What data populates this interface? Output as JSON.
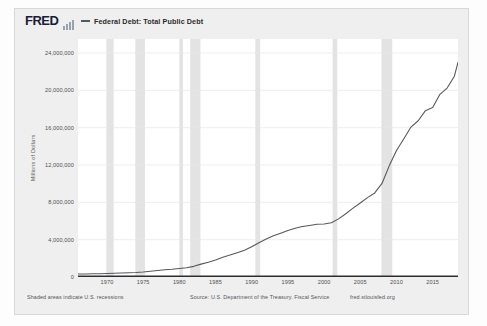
{
  "header": {
    "logo_text": "FRED",
    "sparkline_icon": "sparkline-icon",
    "legend_label": "Federal Debt: Total Public Debt",
    "legend_color": "#55585f"
  },
  "footer": {
    "recessions_note": "Shaded areas indicate U.S. recessions",
    "source": "Source: U.S. Department of the Treasury. Fiscal Service",
    "url": "fred.stlouisfed.org"
  },
  "chart_data": {
    "type": "line",
    "title": "Federal Debt: Total Public Debt",
    "xlabel": "",
    "ylabel": "Millions of Dollars",
    "xlim": [
      1966,
      2018.5
    ],
    "ylim": [
      0,
      25500000
    ],
    "grid": true,
    "legend_position": "top",
    "line_color": "#55585f",
    "recession_band_color": "#e3e3e3",
    "ytick_labels": [
      "0",
      "4,000,000",
      "8,000,000",
      "12,000,000",
      "16,000,000",
      "20,000,000",
      "24,000,000"
    ],
    "ytick_values": [
      0,
      4000000,
      8000000,
      12000000,
      16000000,
      20000000,
      24000000
    ],
    "xtick_labels": [
      "1970",
      "1975",
      "1980",
      "1985",
      "1990",
      "1995",
      "2000",
      "2005",
      "2010",
      "2015"
    ],
    "xtick_values": [
      1970,
      1975,
      1980,
      1985,
      1990,
      1995,
      2000,
      2005,
      2010,
      2015
    ],
    "recessions": [
      {
        "start": 1969.92,
        "end": 1970.92
      },
      {
        "start": 1973.92,
        "end": 1975.25
      },
      {
        "start": 1980.0,
        "end": 1980.5
      },
      {
        "start": 1981.5,
        "end": 1982.92
      },
      {
        "start": 1990.5,
        "end": 1991.17
      },
      {
        "start": 2001.17,
        "end": 2001.83
      },
      {
        "start": 2007.92,
        "end": 2009.42
      }
    ],
    "series": [
      {
        "name": "Federal Debt: Total Public Debt",
        "units": "Millions of Dollars",
        "x": [
          1966,
          1967,
          1968,
          1969,
          1970,
          1971,
          1972,
          1973,
          1974,
          1975,
          1976,
          1977,
          1978,
          1979,
          1980,
          1981,
          1982,
          1983,
          1984,
          1985,
          1986,
          1987,
          1988,
          1989,
          1990,
          1991,
          1992,
          1993,
          1994,
          1995,
          1996,
          1997,
          1998,
          1999,
          2000,
          2001,
          2002,
          2003,
          2004,
          2005,
          2006,
          2007,
          2008,
          2009,
          2010,
          2011,
          2012,
          2013,
          2014,
          2015,
          2016,
          2017,
          2018,
          2018.5
        ],
        "values": [
          320000,
          326000,
          348000,
          354000,
          371000,
          398000,
          427000,
          458000,
          475000,
          533000,
          620000,
          699000,
          772000,
          827000,
          908000,
          998000,
          1142000,
          1377000,
          1572000,
          1823000,
          2125000,
          2350000,
          2602000,
          2857000,
          3233000,
          3665000,
          4064000,
          4411000,
          4693000,
          4974000,
          5225000,
          5413000,
          5526000,
          5656000,
          5674000,
          5807000,
          6228000,
          6783000,
          7379000,
          7933000,
          8507000,
          9008000,
          10025000,
          11910000,
          13562000,
          14790000,
          16066000,
          16738000,
          17824000,
          18151000,
          19573000,
          20245000,
          21516000,
          23000000
        ]
      }
    ]
  }
}
